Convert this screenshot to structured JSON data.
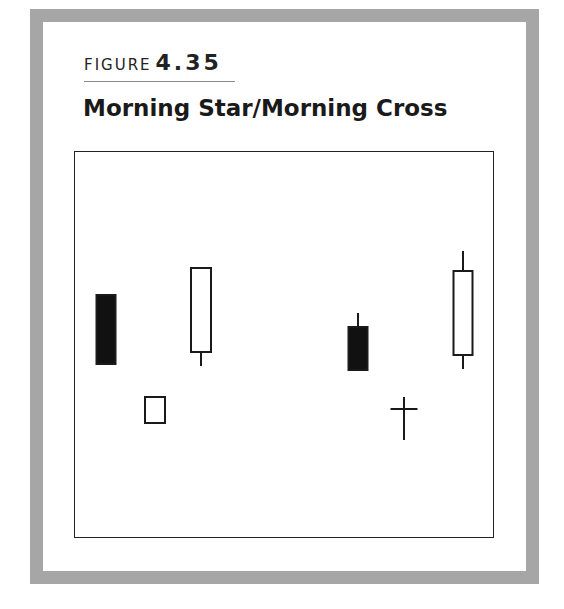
{
  "figure": {
    "label_word": "FIGURE",
    "label_number": "4.35",
    "title": "Morning Star/Morning Cross"
  },
  "colors": {
    "frame": "#a6a6a6",
    "bearish_body": "#111111",
    "bullish_body": "#ffffff",
    "outline": "#1a1a1a"
  },
  "chart_data": {
    "type": "candlestick",
    "title": "Morning Star/Morning Cross",
    "xlabel": "",
    "ylabel": "",
    "grid": false,
    "legend": null,
    "groups": [
      {
        "name": "Morning Star",
        "candles": [
          {
            "index": 1,
            "type": "bearish",
            "open": 295,
            "close": 364,
            "high": 295,
            "low": 364,
            "cx": 106,
            "width": 19
          },
          {
            "index": 2,
            "type": "bullish",
            "open": 423,
            "close": 397,
            "high": 397,
            "low": 423,
            "cx": 155,
            "width": 20
          },
          {
            "index": 3,
            "type": "bullish",
            "open": 352,
            "close": 268,
            "high": 268,
            "low": 366,
            "cx": 201,
            "width": 20
          }
        ]
      },
      {
        "name": "Morning Cross",
        "candles": [
          {
            "index": 4,
            "type": "bearish",
            "open": 327,
            "close": 370,
            "high": 313,
            "low": 370,
            "cx": 358,
            "width": 19
          },
          {
            "index": 5,
            "type": "doji",
            "open": 409,
            "close": 409,
            "high": 397,
            "low": 440,
            "cx": 404,
            "width": 27
          },
          {
            "index": 6,
            "type": "bullish",
            "open": 355,
            "close": 271,
            "high": 251,
            "low": 369,
            "cx": 463,
            "width": 19
          }
        ]
      }
    ],
    "note": "Values are screen-pixel y coordinates (smaller = higher price); no price axis is shown."
  }
}
